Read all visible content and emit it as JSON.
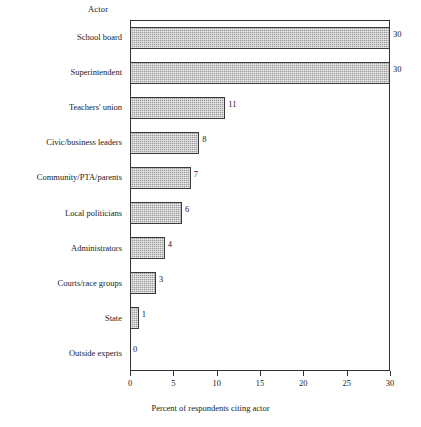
{
  "chart_data": {
    "type": "bar",
    "orientation": "horizontal",
    "title": "",
    "ylabel": "Actor",
    "xlabel": "Percent of respondents citing actor",
    "categories": [
      "School board",
      "Superintendent",
      "Teachers' union",
      "Civic/business leaders",
      "Community/PTA/parents",
      "Local politicians",
      "Administrators",
      "Courts/race groups",
      "State",
      "Outside experts"
    ],
    "values": [
      30,
      30,
      11,
      8,
      7,
      6,
      4,
      3,
      1,
      0
    ],
    "value_labels": [
      "30",
      "30",
      "11",
      "8",
      "7",
      "6",
      "4",
      "3",
      "1",
      "0"
    ],
    "xlim": [
      0,
      30
    ],
    "xticks": [
      0,
      5,
      10,
      15,
      20,
      25,
      30
    ],
    "xtick_labels": [
      "0",
      "5",
      "10",
      "15",
      "20",
      "25",
      "30"
    ],
    "grid": false,
    "legend": false,
    "bar_fill_color": "#9b9b9b",
    "bar_edge_color": "#3a3a3a",
    "axis_color": "#333333",
    "background_color": "#ffffff"
  }
}
